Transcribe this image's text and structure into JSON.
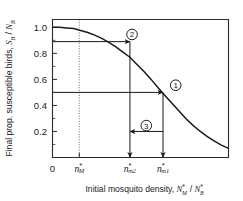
{
  "chart_data": {
    "type": "line",
    "title": "",
    "xlabel": "Initial mosquito density, N*_M / N*_B",
    "ylabel": "Final prop. susceptible birds, S_B / N_B",
    "xlabel_parts": {
      "lead": "Initial mosquito density,",
      "num_var": "N",
      "num_sub": "M",
      "num_sup": "*",
      "slash": "/",
      "den_var": "N",
      "den_sub": "B",
      "den_sup": "*"
    },
    "ylabel_parts": {
      "lead": "Final prop. susceptible birds,",
      "num_var": "S",
      "num_sub": "B",
      "slash": "/",
      "den_var": "N",
      "den_sub": "B"
    },
    "xlim": [
      0,
      1
    ],
    "ylim": [
      0,
      1.06
    ],
    "grid": false,
    "legend": "none",
    "y_ticks": [
      0.2,
      0.4,
      0.6,
      0.8,
      1.0
    ],
    "y_tick_labels": [
      "0.2",
      "0.4",
      "0.6",
      "0.8",
      "1.0"
    ],
    "y_minor_ticks": [
      0.1,
      0.3,
      0.5,
      0.7,
      0.9
    ],
    "x_ticks": [
      0.0,
      0.152,
      0.44,
      0.628
    ],
    "x_tick_labels": [
      "0",
      "n*_M",
      "n*_m2",
      "n*_m1"
    ],
    "x_tick_label_parts": [
      {
        "var": "0",
        "sub": "",
        "sup": "",
        "plain": true
      },
      {
        "var": "n",
        "sub": "M",
        "sup": "*",
        "plain": false
      },
      {
        "var": "n",
        "sub": "m2",
        "sup": "*",
        "plain": false
      },
      {
        "var": "n",
        "sub": "m1",
        "sup": "*",
        "plain": false
      }
    ],
    "series": [
      {
        "name": "final susceptible proportion",
        "x": [
          0.0,
          0.04,
          0.08,
          0.12,
          0.16,
          0.2,
          0.24,
          0.28,
          0.32,
          0.36,
          0.4,
          0.44,
          0.48,
          0.52,
          0.56,
          0.6,
          0.64,
          0.68,
          0.72,
          0.76,
          0.8,
          0.84,
          0.88,
          0.92,
          0.96,
          1.0
        ],
        "values": [
          1.0,
          1.0,
          0.995,
          0.99,
          0.975,
          0.96,
          0.94,
          0.915,
          0.885,
          0.85,
          0.81,
          0.77,
          0.715,
          0.66,
          0.6,
          0.535,
          0.475,
          0.415,
          0.355,
          0.295,
          0.245,
          0.2,
          0.16,
          0.125,
          0.095,
          0.07
        ]
      }
    ],
    "annotations": [
      {
        "id": "1",
        "label": "1",
        "badge_x": 0.7,
        "badge_y": 0.555,
        "h_arrow": {
          "y": 0.5,
          "x_start": 0.0,
          "x_end": 0.628,
          "direction": "right"
        },
        "v_arrow": {
          "x": 0.628,
          "y_start": 0.5,
          "y_end": 0.0,
          "direction": "down"
        }
      },
      {
        "id": "2",
        "label": "2",
        "badge_x": 0.452,
        "badge_y": 0.945,
        "h_arrow": {
          "y": 0.89,
          "x_start": 0.0,
          "x_end": 0.44,
          "direction": "right"
        },
        "v_arrow": {
          "x": 0.44,
          "y_start": 0.89,
          "y_end": 0.0,
          "direction": "down"
        }
      },
      {
        "id": "3",
        "label": "3",
        "badge_x": 0.533,
        "badge_y": 0.245,
        "h_arrow": {
          "y": 0.2,
          "x_start": 0.628,
          "x_end": 0.44,
          "direction": "left"
        }
      }
    ],
    "threshold_line": {
      "name": "mosquito threshold density",
      "x": 0.152,
      "style": "dotted",
      "label": "n*_M"
    },
    "colors": {
      "curve": "#1a1a1a",
      "axis": "#2a2a2a",
      "guide": "#1a1a1a",
      "threshold": "#555555",
      "background": "#ffffff"
    }
  }
}
